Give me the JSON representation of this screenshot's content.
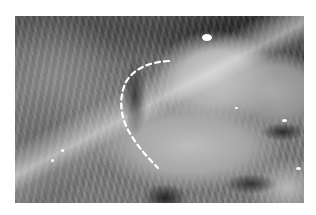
{
  "image": {
    "description": "Grayscale laparoscopic view of abdominal cavity with bowel loops and peritoneal tissue",
    "frame": {
      "x": 15,
      "y": 16,
      "width": 289,
      "height": 187
    },
    "background_color": "#ffffff"
  },
  "annotation": {
    "type": "dashed-curve",
    "color": "#ffffff",
    "points": [
      [
        169,
        61
      ],
      [
        150,
        64
      ],
      [
        133,
        72
      ],
      [
        124,
        84
      ],
      [
        120,
        100
      ],
      [
        122,
        115
      ],
      [
        127,
        128
      ],
      [
        136,
        142
      ],
      [
        146,
        156
      ],
      [
        158,
        168
      ]
    ]
  },
  "highlights": [
    {
      "x": 206,
      "y": 37,
      "r": 4
    },
    {
      "x": 284,
      "y": 120,
      "r": 2
    },
    {
      "x": 298,
      "y": 168,
      "r": 2
    },
    {
      "x": 52,
      "y": 160,
      "r": 1.5
    },
    {
      "x": 62,
      "y": 150,
      "r": 1.5
    },
    {
      "x": 236,
      "y": 108,
      "r": 1.5
    }
  ]
}
